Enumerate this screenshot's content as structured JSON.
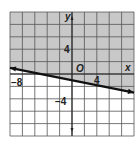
{
  "chart_data": {
    "type": "line",
    "title": "",
    "xlabel": "x",
    "ylabel": "y",
    "xlim": [
      -10,
      10
    ],
    "ylim": [
      -10,
      10
    ],
    "grid": true,
    "grid_step": 2,
    "tick_labels": {
      "x": [
        {
          "value": -8,
          "label": "−8"
        },
        {
          "value": 4,
          "label": "4"
        }
      ],
      "y": [
        {
          "value": 4,
          "label": "4"
        },
        {
          "value": -4,
          "label": "−4"
        }
      ],
      "origin": "O"
    },
    "series": [
      {
        "name": "boundary line",
        "style": "solid",
        "equation": "y = -x/5 - 1",
        "x": [
          -10,
          10
        ],
        "y": [
          1,
          -3
        ]
      }
    ],
    "shaded_region": "above the line (y ≥ -x/5 - 1)",
    "legend": null
  },
  "colors": {
    "shade": "#c8c8c8",
    "grid": "#555555",
    "line": "#111111",
    "background": "#ffffff"
  },
  "labels": {
    "x_axis": "x",
    "y_axis": "y",
    "origin": "O",
    "x_neg8": "−8",
    "x_4": "4",
    "y_4": "4",
    "y_neg4": "−4"
  }
}
